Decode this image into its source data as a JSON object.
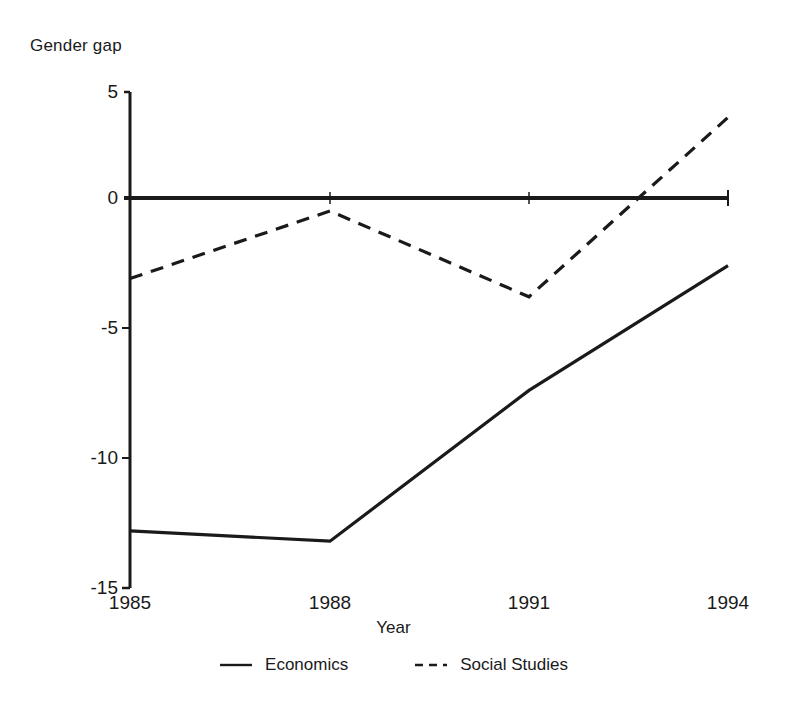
{
  "chart_data": {
    "type": "line",
    "title": "",
    "ylabel": "Gender gap",
    "xlabel": "Year",
    "x": [
      1985,
      1988,
      1991,
      1994
    ],
    "xticklabels": [
      "1985",
      "1988",
      "1991",
      "1994"
    ],
    "yticklabels": [
      "5",
      "0",
      "-5",
      "-10",
      "-15"
    ],
    "yticks": [
      5,
      0,
      -5,
      -10,
      -15
    ],
    "ylim": [
      -15,
      5
    ],
    "xlim": [
      1985,
      1994
    ],
    "grid": false,
    "legend_position": "below",
    "zero_line": true,
    "series": [
      {
        "name": "Economics",
        "style": "solid",
        "color": "#1a1a1a",
        "values": [
          -12.8,
          -13.2,
          -7.4,
          -2.6
        ]
      },
      {
        "name": "Social Studies",
        "style": "dashed",
        "color": "#1a1a1a",
        "values": [
          -3.1,
          -0.5,
          -3.8,
          3.1
        ]
      }
    ]
  },
  "axis": {
    "y_label": "Gender gap",
    "x_label": "Year",
    "y_ticks": [
      {
        "label": "5"
      },
      {
        "label": "0"
      },
      {
        "label": "-5"
      },
      {
        "label": "-10"
      },
      {
        "label": "-15"
      }
    ],
    "x_ticks": [
      {
        "label": "1985"
      },
      {
        "label": "1988"
      },
      {
        "label": "1991"
      },
      {
        "label": "1994"
      }
    ]
  },
  "legend": {
    "items": [
      {
        "label": "Economics",
        "style": "solid"
      },
      {
        "label": "Social Studies",
        "style": "dashed"
      }
    ]
  }
}
